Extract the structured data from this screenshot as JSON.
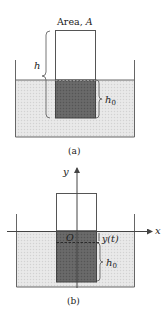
{
  "figure_a": {
    "area_label_prefix": "Area, ",
    "area_label_var": "A",
    "h_label": "h",
    "h0_label_main": "h",
    "h0_label_sub": "0",
    "caption": "(a)"
  },
  "figure_b": {
    "y_axis_label": "y",
    "x_axis_label": "x",
    "origin_label": "O",
    "displacement_label": "y(t)",
    "h0_label_main": "h",
    "h0_label_sub": "0",
    "caption": "(b)"
  },
  "colors": {
    "water": "#e4e4e4",
    "block_submerged": "#666666",
    "lines": "#555555"
  }
}
